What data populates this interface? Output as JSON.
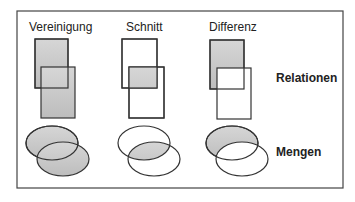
{
  "columns": [
    {
      "label": "Vereinigung"
    },
    {
      "label": "Schnitt"
    },
    {
      "label": "Differenz"
    }
  ],
  "rows": [
    {
      "label": "Relationen"
    },
    {
      "label": "Mengen"
    }
  ],
  "colors": {
    "fill": "#c8c8c8",
    "stroke": "#333333",
    "frame": "#444444"
  }
}
